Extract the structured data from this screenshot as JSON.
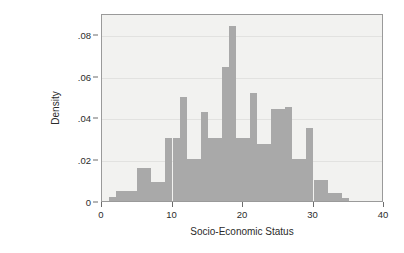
{
  "chart_data": {
    "type": "bar",
    "title": "",
    "subtitle": "",
    "xlabel": "Socio-Economic Status",
    "ylabel": "Density",
    "xlim": [
      0,
      40
    ],
    "ylim": [
      0,
      0.09
    ],
    "grid": true,
    "legend": null,
    "bin_width": 1,
    "x_tick_labels": [
      "0",
      "10",
      "20",
      "30",
      "40"
    ],
    "x_tick_values": [
      0,
      10,
      20,
      30,
      40
    ],
    "y_tick_labels": [
      "0",
      ".02",
      ".04",
      ".06",
      ".08"
    ],
    "y_tick_values": [
      0,
      0.02,
      0.04,
      0.06,
      0.08
    ],
    "bin_starts": [
      0,
      1,
      2,
      3,
      4,
      5,
      6,
      7,
      8,
      9,
      10,
      11,
      12,
      13,
      14,
      15,
      16,
      17,
      18,
      19,
      20,
      21,
      22,
      23,
      24,
      25,
      26,
      27,
      28,
      29,
      30,
      31,
      32,
      33,
      34
    ],
    "values": [
      0.0,
      0.002,
      0.005,
      0.005,
      0.005,
      0.016,
      0.016,
      0.009,
      0.009,
      0.03,
      0.03,
      0.05,
      0.02,
      0.02,
      0.0425,
      0.03,
      0.03,
      0.064,
      0.084,
      0.03,
      0.03,
      0.0515,
      0.0275,
      0.0275,
      0.044,
      0.044,
      0.045,
      0.02,
      0.02,
      0.035,
      0.01,
      0.01,
      0.004,
      0.004,
      0.0015
    ],
    "bar_color": "#a9a9a9",
    "plot_background": "#f2f2f0",
    "figure_background": "#ffffff",
    "axis_color": "#9a9a9a",
    "grid_color": "#e2e2e0"
  }
}
